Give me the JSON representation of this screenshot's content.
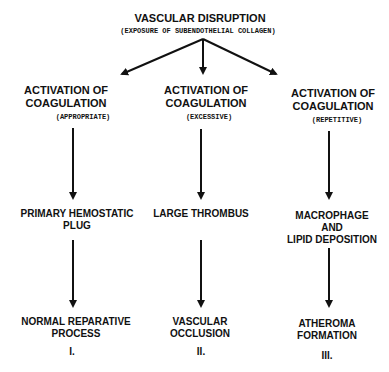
{
  "root": {
    "title": "VASCULAR DISRUPTION",
    "subtitle": "(EXPOSURE OF SUBENDOTHELIAL COLLAGEN)"
  },
  "branches": [
    {
      "activation": [
        "ACTIVATION OF",
        "COAGULATION"
      ],
      "qualifier": "(APPROPRIATE)",
      "intermediate": [
        "PRIMARY HEMOSTATIC",
        "PLUG"
      ],
      "outcome": [
        "NORMAL REPARATIVE",
        "PROCESS"
      ],
      "numeral": "I."
    },
    {
      "activation": [
        "ACTIVATION OF",
        "COAGULATION"
      ],
      "qualifier": "(EXCESSIVE)",
      "intermediate": [
        "LARGE THROMBUS"
      ],
      "outcome": [
        "VASCULAR",
        "OCCLUSION"
      ],
      "numeral": "II."
    },
    {
      "activation": [
        "ACTIVATION OF",
        "COAGULATION"
      ],
      "qualifier": "(REPETITIVE)",
      "intermediate": [
        "MACROPHAGE",
        "AND",
        "LIPID DEPOSITION"
      ],
      "outcome": [
        "ATHEROMA",
        "FORMATION"
      ],
      "numeral": "III."
    }
  ]
}
